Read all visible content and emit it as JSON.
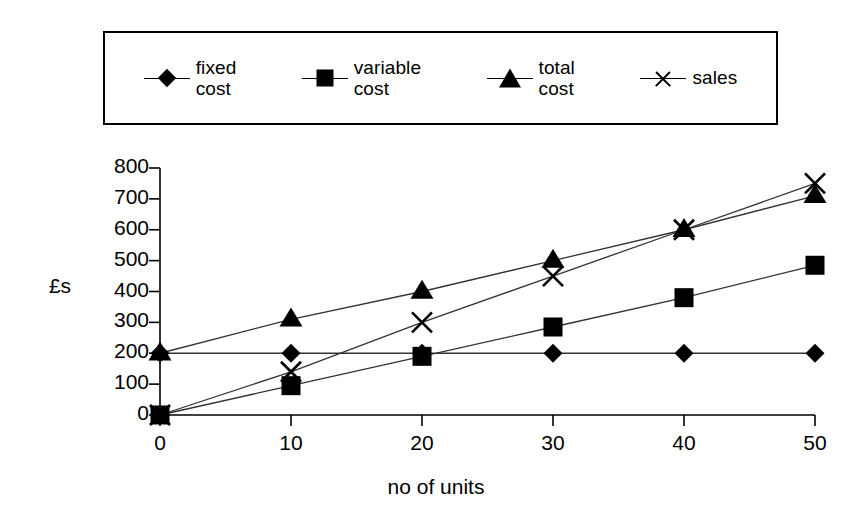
{
  "legend": {
    "position": "top",
    "boxed": true,
    "entries": [
      {
        "label": "fixed\ncost",
        "marker": "diamond",
        "name": "fixed cost"
      },
      {
        "label": "variable\ncost",
        "marker": "square",
        "name": "variable cost"
      },
      {
        "label": "total\ncost",
        "marker": "triangle",
        "name": "total cost"
      },
      {
        "label": "sales",
        "marker": "cross",
        "name": "sales"
      }
    ]
  },
  "axes": {
    "y_title": "£s",
    "x_title": "no of units",
    "y_ticks": [
      "0",
      "100",
      "200",
      "300",
      "400",
      "500",
      "600",
      "700",
      "800"
    ],
    "x_ticks": [
      "0",
      "10",
      "20",
      "30",
      "40",
      "50"
    ]
  },
  "colors": {
    "ink": "#000000",
    "background": "#ffffff",
    "series_line": "#333333"
  },
  "chart_data": {
    "type": "line",
    "title": "",
    "subtitle": "",
    "xlabel": "no of units",
    "ylabel": "£s",
    "x": [
      0,
      10,
      20,
      30,
      40,
      50
    ],
    "xlim": [
      0,
      50
    ],
    "ylim": [
      0,
      800
    ],
    "xticks": [
      0,
      10,
      20,
      30,
      40,
      50
    ],
    "yticks": [
      0,
      100,
      200,
      300,
      400,
      500,
      600,
      700,
      800
    ],
    "grid": false,
    "legend_position": "top",
    "annotations": [],
    "series": [
      {
        "name": "fixed cost",
        "marker": "diamond",
        "values": [
          200,
          200,
          200,
          200,
          200,
          200
        ]
      },
      {
        "name": "variable cost",
        "marker": "square",
        "values": [
          0,
          95,
          190,
          285,
          380,
          485
        ]
      },
      {
        "name": "total cost",
        "marker": "triangle",
        "values": [
          200,
          310,
          400,
          500,
          600,
          710
        ]
      },
      {
        "name": "sales",
        "marker": "cross",
        "values": [
          0,
          140,
          300,
          450,
          600,
          750
        ]
      }
    ]
  }
}
